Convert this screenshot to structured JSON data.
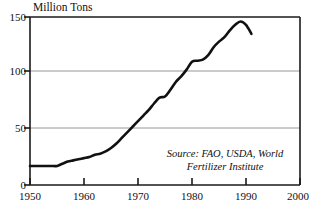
{
  "chart_data": {
    "type": "line",
    "title": "Million Tons",
    "xlabel": "",
    "ylabel": "Million Tons",
    "xlim": [
      1950,
      2000
    ],
    "ylim": [
      0,
      150
    ],
    "xticks": [
      1950,
      1960,
      1970,
      1980,
      1990,
      2000
    ],
    "xticklabels": [
      "1950",
      "1960",
      "1970",
      "1980",
      "1990",
      "2000"
    ],
    "yticks": [
      0,
      50,
      100,
      150
    ],
    "yticklabels": [
      "0",
      "50",
      "100",
      "150"
    ],
    "grid": "horizontal",
    "legend": "none",
    "line_color": "#111111",
    "line_width": 2.6,
    "annotations": [
      {
        "name": "source-note",
        "line1": "Source: FAO, USDA, World",
        "line2": "Fertilizer Institute",
        "style": "italic"
      }
    ],
    "series": [
      {
        "name": "World Fertilizer Use",
        "x": [
          1950,
          1951,
          1952,
          1953,
          1954,
          1955,
          1956,
          1957,
          1958,
          1959,
          1960,
          1961,
          1962,
          1963,
          1964,
          1965,
          1966,
          1967,
          1968,
          1969,
          1970,
          1971,
          1972,
          1973,
          1974,
          1975,
          1976,
          1977,
          1978,
          1979,
          1980,
          1981,
          1982,
          1983,
          1984,
          1985,
          1986,
          1987,
          1988,
          1989,
          1990,
          1991
        ],
        "values": [
          17,
          17,
          17,
          17,
          17,
          17,
          19,
          21,
          22,
          23,
          24,
          25,
          27,
          28,
          30,
          33,
          37,
          42,
          47,
          52,
          57,
          62,
          67,
          73,
          78,
          79,
          85,
          92,
          97,
          103,
          110,
          111,
          112,
          116,
          123,
          128,
          132,
          138,
          143,
          146,
          143,
          135
        ]
      }
    ]
  }
}
